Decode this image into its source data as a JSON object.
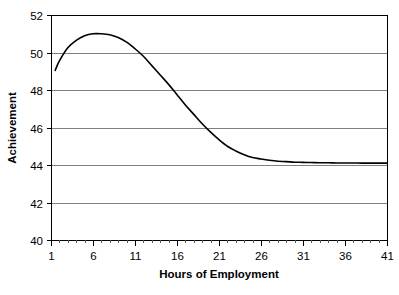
{
  "chart_data": {
    "type": "line",
    "title": "",
    "xlabel": "Hours of Employment",
    "ylabel": "Achievement",
    "xlim": [
      1,
      41
    ],
    "ylim": [
      40,
      52
    ],
    "xticks": [
      1,
      6,
      11,
      16,
      21,
      26,
      31,
      36,
      41
    ],
    "yticks": [
      40,
      42,
      44,
      46,
      48,
      50,
      52
    ],
    "xtick_labels": [
      "1",
      "6",
      "11",
      "16",
      "21",
      "26",
      "31",
      "36",
      "41"
    ],
    "ytick_labels": [
      "40",
      "42",
      "44",
      "46",
      "48",
      "50",
      "52"
    ],
    "x_minor_tick_step": 1,
    "grid": "horizontal",
    "legend": "none",
    "series": [
      {
        "name": "Achievement",
        "color": "#000000",
        "x": [
          1.5,
          2,
          3,
          4,
          5,
          6,
          7,
          8,
          9,
          10,
          11,
          12,
          13,
          14,
          15,
          16,
          17,
          18,
          19,
          20,
          21,
          22,
          23,
          24,
          25,
          26,
          27,
          28,
          29,
          30,
          31,
          32,
          33,
          34,
          35,
          36,
          37,
          38,
          39,
          40,
          41
        ],
        "values": [
          49.05,
          49.55,
          50.25,
          50.65,
          50.9,
          51.0,
          51.0,
          50.95,
          50.8,
          50.55,
          50.2,
          49.8,
          49.3,
          48.8,
          48.3,
          47.75,
          47.2,
          46.7,
          46.2,
          45.75,
          45.35,
          45.0,
          44.75,
          44.55,
          44.4,
          44.32,
          44.25,
          44.2,
          44.18,
          44.15,
          44.14,
          44.13,
          44.12,
          44.12,
          44.11,
          44.11,
          44.11,
          44.1,
          44.1,
          44.1,
          44.1
        ]
      }
    ]
  },
  "axis": {
    "x_title": "Hours of Employment",
    "y_title": "Achievement"
  }
}
